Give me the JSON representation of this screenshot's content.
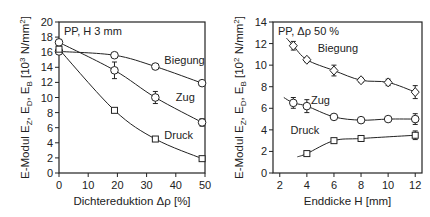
{
  "chart_data": [
    {
      "type": "line",
      "title": "PP, H 3 mm",
      "xlabel": "Dichtereduktion Δρ [%]",
      "ylabel": "E-Modul E_Z, E_D, E_B [10^3 N/mm^2]",
      "xlim": [
        0,
        50
      ],
      "ylim": [
        0,
        20
      ],
      "xticks": [
        0,
        10,
        20,
        30,
        40,
        50
      ],
      "yticks": [
        0,
        2,
        4,
        6,
        8,
        10,
        12,
        14,
        16,
        18,
        20
      ],
      "grid": false,
      "series": [
        {
          "name": "Biegung",
          "marker": "circle",
          "x": [
            0,
            19,
            33,
            49
          ],
          "y": [
            16.1,
            15.6,
            14.1,
            11.9
          ],
          "err": [
            0.3,
            0.3,
            0.3,
            0.3
          ]
        },
        {
          "name": "Zug",
          "marker": "circle",
          "x": [
            0,
            19,
            33,
            49
          ],
          "y": [
            17.3,
            13.6,
            10.0,
            6.7
          ],
          "err": [
            0.4,
            1.1,
            0.8,
            0.5
          ]
        },
        {
          "name": "Druck",
          "marker": "square",
          "x": [
            0,
            19,
            33,
            49
          ],
          "y": [
            16.4,
            8.3,
            4.5,
            1.9
          ],
          "err": [
            0.3,
            0.2,
            0.2,
            0.2
          ]
        }
      ]
    },
    {
      "type": "line",
      "title": "PP, Δρ 50 %",
      "xlabel": "Enddicke H [mm]",
      "ylabel": "E-Modul E_Z, E_D, E_B [10^2 N/mm^2]",
      "xlim": [
        1.5,
        12.5
      ],
      "ylim": [
        0,
        14
      ],
      "xticks": [
        2,
        4,
        6,
        8,
        10,
        12
      ],
      "yticks": [
        0,
        2,
        4,
        6,
        8,
        10,
        12,
        14
      ],
      "grid": false,
      "series": [
        {
          "name": "Biegung",
          "marker": "diamond",
          "x": [
            3,
            4,
            6,
            8,
            10,
            12
          ],
          "y": [
            11.8,
            10.5,
            9.5,
            8.6,
            8.4,
            7.5
          ],
          "err": [
            0.4,
            0.2,
            0.5,
            0.2,
            0.3,
            0.6
          ]
        },
        {
          "name": "Zug",
          "marker": "circle",
          "x": [
            3,
            4,
            6,
            8,
            10,
            12
          ],
          "y": [
            6.5,
            6.2,
            5.2,
            4.9,
            5.0,
            5.0
          ],
          "err": [
            0.5,
            0.6,
            0.2,
            0.2,
            0.2,
            0.5
          ]
        },
        {
          "name": "Druck",
          "marker": "square",
          "x": [
            4,
            6,
            8,
            12
          ],
          "y": [
            1.8,
            3.0,
            3.2,
            3.5
          ],
          "err": [
            0.2,
            0.2,
            0.2,
            0.4
          ]
        }
      ]
    }
  ],
  "left": {
    "annotation": "PP, H 3 mm",
    "ylabel": "E-Modul E",
    "ylabel_sub": [
      "Z",
      "D",
      "B"
    ],
    "ylabel_unit": "[10",
    "ylabel_exp": "3",
    "ylabel_unit2": " N/mm",
    "ylabel_exp2": "2",
    "xlabel": "Dichtereduktion Δρ [%]",
    "labels": {
      "biegung": "Biegung",
      "zug": "Zug",
      "druck": "Druck"
    }
  },
  "right": {
    "annotation": "PP, Δρ 50 %",
    "ylabel": "E-Modul E",
    "ylabel_sub": [
      "Z",
      "D",
      "B"
    ],
    "ylabel_unit": "[10",
    "ylabel_exp": "2",
    "ylabel_unit2": " N/mm",
    "ylabel_exp2": "2",
    "xlabel": "Enddicke H [mm]",
    "labels": {
      "biegung": "Biegung",
      "zug": "Zug",
      "druck": "Druck"
    }
  }
}
